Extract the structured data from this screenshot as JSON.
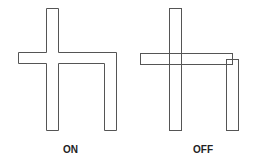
{
  "figures": [
    {
      "id": "on",
      "label": "ON"
    },
    {
      "id": "off",
      "label": "OFF"
    }
  ],
  "colors": {
    "stroke": "#555555",
    "background": "#ffffff",
    "label": "#222222"
  }
}
